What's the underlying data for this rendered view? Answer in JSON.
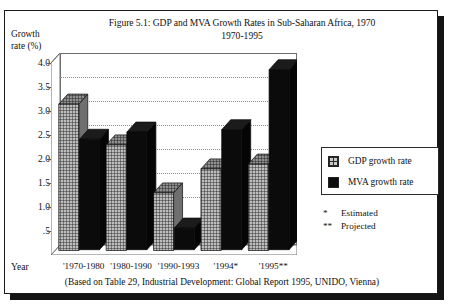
{
  "figure": {
    "title": "Figure 5.1: GDP and MVA Growth Rates in Sub-Saharan Africa, 1970",
    "subtitle": "1970-1995",
    "y_axis_title_line1": "Growth",
    "y_axis_title_line2": "rate (%)",
    "x_axis_title": "Year",
    "source_note": "(Based on Table 29, Industrial Development: Global Report 1995, UNIDO, Vienna)"
  },
  "legend": {
    "items": [
      {
        "label": "GDP growth rate",
        "swatch": "hatched-crosshatch",
        "color": "#c9c9c9"
      },
      {
        "label": "MVA growth rate",
        "swatch": "solid-black",
        "color": "#0d0d0d"
      }
    ]
  },
  "footnotes": [
    {
      "mark": "*",
      "text": "Estimated"
    },
    {
      "mark": "**",
      "text": "Projected"
    }
  ],
  "chart_data": {
    "type": "bar",
    "title": "Figure 5.1: GDP and MVA Growth Rates in Sub-Saharan Africa, 1970 1970-1995",
    "xlabel": "Year",
    "ylabel": "Growth rate (%)",
    "ylim": [
      0,
      4.0
    ],
    "ytick_labels": [
      "4.0",
      "3.5",
      "3.0",
      "2.5",
      "2.0",
      "1.5",
      "1.0",
      ".5"
    ],
    "ytick_values": [
      4.0,
      3.5,
      3.0,
      2.5,
      2.0,
      1.5,
      1.0,
      0.5
    ],
    "grid": true,
    "grid_style": "dotted-horizontal",
    "legend_position": "right",
    "categories": [
      "'1970-1980",
      "'1980-1990",
      "'1990-1993",
      "'1994*",
      "'1995**"
    ],
    "series": [
      {
        "name": "GDP growth rate",
        "values": [
          3.05,
          2.2,
          1.2,
          1.7,
          1.8
        ]
      },
      {
        "name": "MVA growth rate",
        "values": [
          2.3,
          2.45,
          0.45,
          2.5,
          3.75
        ]
      }
    ]
  }
}
